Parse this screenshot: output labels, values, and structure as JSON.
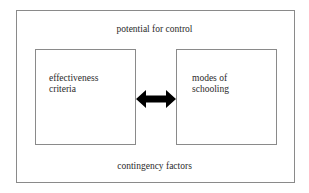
{
  "diagram": {
    "outer_label_top": "potential for control",
    "outer_label_bottom": "contingency factors",
    "left_box": {
      "label": "effectiveness\ncriteria"
    },
    "right_box": {
      "label": "modes of\nschooling"
    },
    "connector": {
      "type": "double-headed-arrow",
      "color": "#000000"
    }
  }
}
